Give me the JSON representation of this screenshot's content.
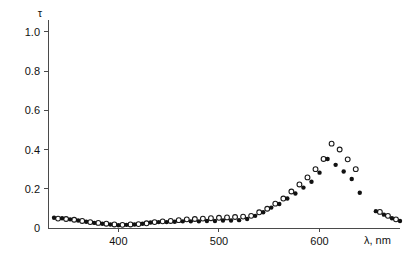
{
  "chart_data": {
    "type": "scatter",
    "title": "",
    "subtitle": "",
    "xlabel": "λ, nm",
    "ylabel": "τ",
    "xlim": [
      330,
      680
    ],
    "ylim": [
      0,
      1.05
    ],
    "grid": false,
    "legend_position": "none",
    "x_ticks": [
      400,
      500,
      600
    ],
    "x_tick_labels": [
      "400",
      "500",
      "600"
    ],
    "y_ticks": [
      0,
      0.2,
      0.4,
      0.6,
      0.8,
      1.0
    ],
    "y_tick_labels": [
      "0",
      "0.2",
      "0.4",
      "0.6",
      "0.8",
      "1.0"
    ],
    "series": [
      {
        "name": "open-circles",
        "marker": "open-circle",
        "color": "#1a1a1a",
        "points": [
          [
            340,
            0.048
          ],
          [
            348,
            0.046
          ],
          [
            356,
            0.042
          ],
          [
            364,
            0.036
          ],
          [
            372,
            0.03
          ],
          [
            380,
            0.026
          ],
          [
            388,
            0.022
          ],
          [
            396,
            0.018
          ],
          [
            404,
            0.016
          ],
          [
            412,
            0.018
          ],
          [
            420,
            0.02
          ],
          [
            428,
            0.024
          ],
          [
            436,
            0.03
          ],
          [
            444,
            0.034
          ],
          [
            452,
            0.036
          ],
          [
            460,
            0.04
          ],
          [
            468,
            0.044
          ],
          [
            476,
            0.046
          ],
          [
            484,
            0.048
          ],
          [
            492,
            0.05
          ],
          [
            500,
            0.052
          ],
          [
            508,
            0.054
          ],
          [
            516,
            0.056
          ],
          [
            524,
            0.058
          ],
          [
            532,
            0.062
          ],
          [
            540,
            0.08
          ],
          [
            548,
            0.098
          ],
          [
            556,
            0.124
          ],
          [
            564,
            0.15
          ],
          [
            572,
            0.186
          ],
          [
            580,
            0.222
          ],
          [
            588,
            0.258
          ],
          [
            596,
            0.3
          ],
          [
            604,
            0.352
          ],
          [
            612,
            0.43
          ],
          [
            620,
            0.4
          ],
          [
            628,
            0.35
          ],
          [
            636,
            0.3
          ],
          [
            660,
            0.082
          ],
          [
            668,
            0.062
          ],
          [
            676,
            0.044
          ]
        ]
      },
      {
        "name": "filled-circles",
        "marker": "filled-circle",
        "color": "#111111",
        "points": [
          [
            336,
            0.052
          ],
          [
            344,
            0.05
          ],
          [
            352,
            0.044
          ],
          [
            360,
            0.038
          ],
          [
            368,
            0.032
          ],
          [
            376,
            0.026
          ],
          [
            384,
            0.022
          ],
          [
            392,
            0.018
          ],
          [
            400,
            0.014
          ],
          [
            408,
            0.016
          ],
          [
            416,
            0.018
          ],
          [
            424,
            0.022
          ],
          [
            432,
            0.028
          ],
          [
            440,
            0.03
          ],
          [
            448,
            0.03
          ],
          [
            456,
            0.032
          ],
          [
            464,
            0.034
          ],
          [
            472,
            0.034
          ],
          [
            480,
            0.034
          ],
          [
            488,
            0.036
          ],
          [
            496,
            0.036
          ],
          [
            504,
            0.038
          ],
          [
            512,
            0.038
          ],
          [
            520,
            0.04
          ],
          [
            528,
            0.046
          ],
          [
            536,
            0.062
          ],
          [
            544,
            0.08
          ],
          [
            552,
            0.104
          ],
          [
            560,
            0.122
          ],
          [
            568,
            0.15
          ],
          [
            576,
            0.176
          ],
          [
            584,
            0.206
          ],
          [
            592,
            0.236
          ],
          [
            600,
            0.282
          ],
          [
            608,
            0.352
          ],
          [
            616,
            0.322
          ],
          [
            624,
            0.288
          ],
          [
            632,
            0.25
          ],
          [
            640,
            0.18
          ],
          [
            656,
            0.086
          ],
          [
            664,
            0.068
          ],
          [
            672,
            0.05
          ],
          [
            680,
            0.036
          ]
        ]
      }
    ]
  }
}
